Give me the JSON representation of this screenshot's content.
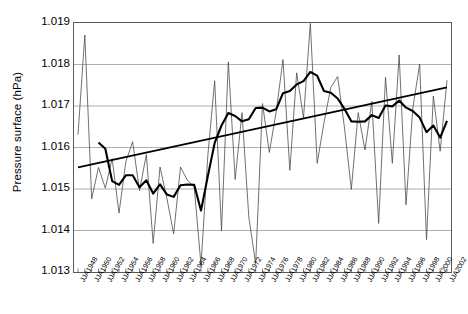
{
  "chart_data": {
    "type": "line",
    "title": "",
    "xlabel": "",
    "ylabel": "Pressure surface (hPa)",
    "ylim": [
      1.013,
      1.019
    ],
    "yticks": [
      "1.019",
      "1.018",
      "1.017",
      "1.016",
      "1.015",
      "1.014",
      "1.013"
    ],
    "ytick_values": [
      1.019,
      1.018,
      1.017,
      1.016,
      1.015,
      1.014,
      1.013
    ],
    "grid": true,
    "grid_axis": "y",
    "legend": "none",
    "x_prefix": "JJA",
    "x_start_year": 1948,
    "x_end_year": 2002,
    "x_tick_step_years": 2,
    "x_minor_tick_step_years": 1,
    "xtick_labels": [
      "JJA1948",
      "JJA1950",
      "JJA1952",
      "JJA1954",
      "JJA1956",
      "JJA1958",
      "JJA1960",
      "JJA1962",
      "JJA1964",
      "JJA1966",
      "JJA1968",
      "JJA1970",
      "JJA1972",
      "JJA1974",
      "JJA1976",
      "JJA1978",
      "JJA1980",
      "JJA1982",
      "JJA1984",
      "JJA1986",
      "JJA1988",
      "JJA1990",
      "JJA1992",
      "JJA1994",
      "JJA1996",
      "JJA1998",
      "JJA2000",
      "JJA2002"
    ],
    "x": [
      1948,
      1949,
      1950,
      1951,
      1952,
      1953,
      1954,
      1955,
      1956,
      1957,
      1958,
      1959,
      1960,
      1961,
      1962,
      1963,
      1964,
      1965,
      1966,
      1967,
      1968,
      1969,
      1970,
      1971,
      1972,
      1973,
      1974,
      1975,
      1976,
      1977,
      1978,
      1979,
      1980,
      1981,
      1982,
      1983,
      1984,
      1985,
      1986,
      1987,
      1988,
      1989,
      1990,
      1991,
      1992,
      1993,
      1994,
      1995,
      1996,
      1997,
      1998,
      1999,
      2000,
      2001,
      2002
    ],
    "series": [
      {
        "name": "Annual JJA mean",
        "style": "thin-line",
        "color": "#4d4d4d",
        "width": 0.8,
        "values": [
          1.01631,
          1.01871,
          1.01476,
          1.01552,
          1.01502,
          1.01573,
          1.01442,
          1.01566,
          1.01614,
          1.01496,
          1.01583,
          1.01369,
          1.01553,
          1.01478,
          1.01392,
          1.01553,
          1.01521,
          1.01506,
          1.01317,
          1.01581,
          1.01761,
          1.01399,
          1.01806,
          1.01523,
          1.01684,
          1.01432,
          1.0132,
          1.01706,
          1.01588,
          1.01686,
          1.01812,
          1.01545,
          1.0178,
          1.01671,
          1.01899,
          1.01562,
          1.0166,
          1.01745,
          1.01771,
          1.01647,
          1.01499,
          1.01684,
          1.01594,
          1.01711,
          1.01417,
          1.01769,
          1.01562,
          1.01823,
          1.01462,
          1.01695,
          1.01801,
          1.01378,
          1.01724,
          1.01591,
          1.01762
        ]
      },
      {
        "name": "Smoothed (running mean)",
        "style": "thick-line",
        "color": "#000000",
        "width": 2.1,
        "values": [
          null,
          null,
          null,
          1.01612,
          1.01597,
          1.01519,
          1.0151,
          1.01533,
          1.01533,
          1.01504,
          1.01521,
          1.01489,
          1.01511,
          1.01487,
          1.01481,
          1.01509,
          1.01511,
          1.0151,
          1.01448,
          1.01531,
          1.01611,
          1.01653,
          1.01683,
          1.01676,
          1.01663,
          1.01668,
          1.01695,
          1.01696,
          1.01687,
          1.01692,
          1.01731,
          1.01736,
          1.01752,
          1.0176,
          1.01782,
          1.01773,
          1.01736,
          1.01732,
          1.01718,
          1.01693,
          1.01663,
          1.01662,
          1.01663,
          1.01678,
          1.01671,
          1.01701,
          1.01699,
          1.01713,
          1.01696,
          1.01688,
          1.01672,
          1.01637,
          1.01653,
          1.01624,
          1.01664
        ]
      },
      {
        "name": "Linear trend",
        "style": "straight-line",
        "color": "#000000",
        "width": 1.7,
        "endpoints": [
          {
            "x": 1948,
            "y": 1.01552
          },
          {
            "x": 2002,
            "y": 1.01745
          }
        ]
      }
    ]
  }
}
